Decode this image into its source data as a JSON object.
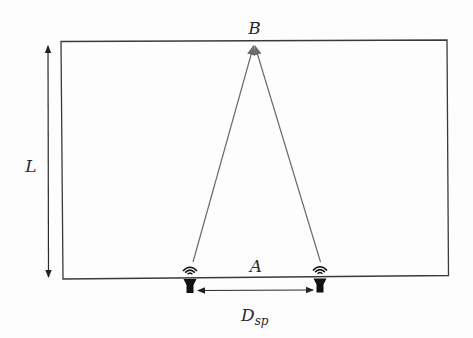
{
  "diagram": {
    "type": "room-speaker-geometry",
    "colors": {
      "room_outline": "#3a3a3a",
      "sound_paths": "#6a6a6a",
      "dimension_arrows": "#2a2a2a",
      "speaker_fill": "#111111",
      "label": "#2a2a2a"
    },
    "labels": {
      "listening_point_top": "B",
      "listening_point_bottom": "A",
      "room_length": "L",
      "speaker_distance_main": "D",
      "speaker_distance_sub": "sp"
    },
    "elements": {
      "room": "rectangle",
      "speakers": [
        {
          "name": "left-speaker",
          "icon": "speaker-icon",
          "waves": 3
        },
        {
          "name": "right-speaker",
          "icon": "speaker-icon",
          "waves": 3
        }
      ],
      "sound_paths": [
        "left-speaker to B",
        "right-speaker to B"
      ],
      "dimensions": [
        {
          "name": "L",
          "orientation": "vertical",
          "double_headed": true
        },
        {
          "name": "D_sp",
          "orientation": "horizontal",
          "double_headed": true
        }
      ]
    }
  }
}
